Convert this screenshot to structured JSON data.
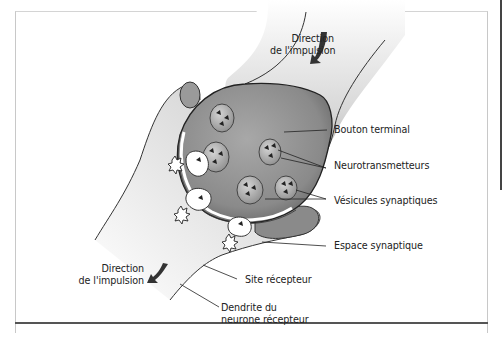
{
  "diagram": {
    "type": "synapse-anatomy",
    "labels": {
      "direction_top_line1": "Direction",
      "direction_top_line2": "de l'impulsion",
      "bouton_terminal": "Bouton terminal",
      "neurotransmetteurs": "Neurotransmetteurs",
      "vesicules_synaptiques": "Vésicules synaptiques",
      "espace_synaptique": "Espace synaptique",
      "site_recepteur": "Site récepteur",
      "direction_bottom_line1": "Direction",
      "direction_bottom_line2": "de l'impulsion",
      "dendrite_line1": "Dendrite du",
      "dendrite_line2": "neurone récepteur"
    },
    "icons": {
      "arrow_top": "curved-arrow-down-left",
      "arrow_bottom": "curved-arrow-down-left"
    },
    "colors": {
      "terminal_fill": "#8a8a8a",
      "dendrite_fill": "#d6d6d6",
      "outline": "#333333",
      "vesicle_fill": "#b5b5b5",
      "neurotransmitter": "#2a2a2a"
    }
  }
}
